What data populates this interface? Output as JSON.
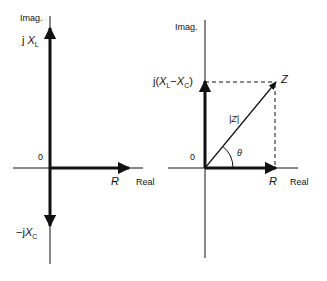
{
  "left_diagram": {
    "imag_axis_label": "Imag.",
    "real_axis_label": "Real",
    "origin_label": "0",
    "up_vector": {
      "prefix": "j",
      "symbol": "X",
      "subscript": "L"
    },
    "down_vector": {
      "prefix": "−j",
      "symbol": "X",
      "subscript": "C"
    },
    "right_vector": {
      "symbol": "R"
    }
  },
  "right_diagram": {
    "imag_axis_label": "Imag.",
    "real_axis_label": "Real",
    "origin_label": "0",
    "up_vector": {
      "prefix": "j(",
      "symbol1": "X",
      "sub1": "L",
      "minus": "−",
      "symbol2": "X",
      "sub2": "C",
      "suffix": ")"
    },
    "right_vector": {
      "symbol": "R"
    },
    "resultant_label": "Z",
    "magnitude_label": "|Z|",
    "angle_label": "θ"
  },
  "colors": {
    "stroke": "#111111",
    "background": "#ffffff"
  }
}
